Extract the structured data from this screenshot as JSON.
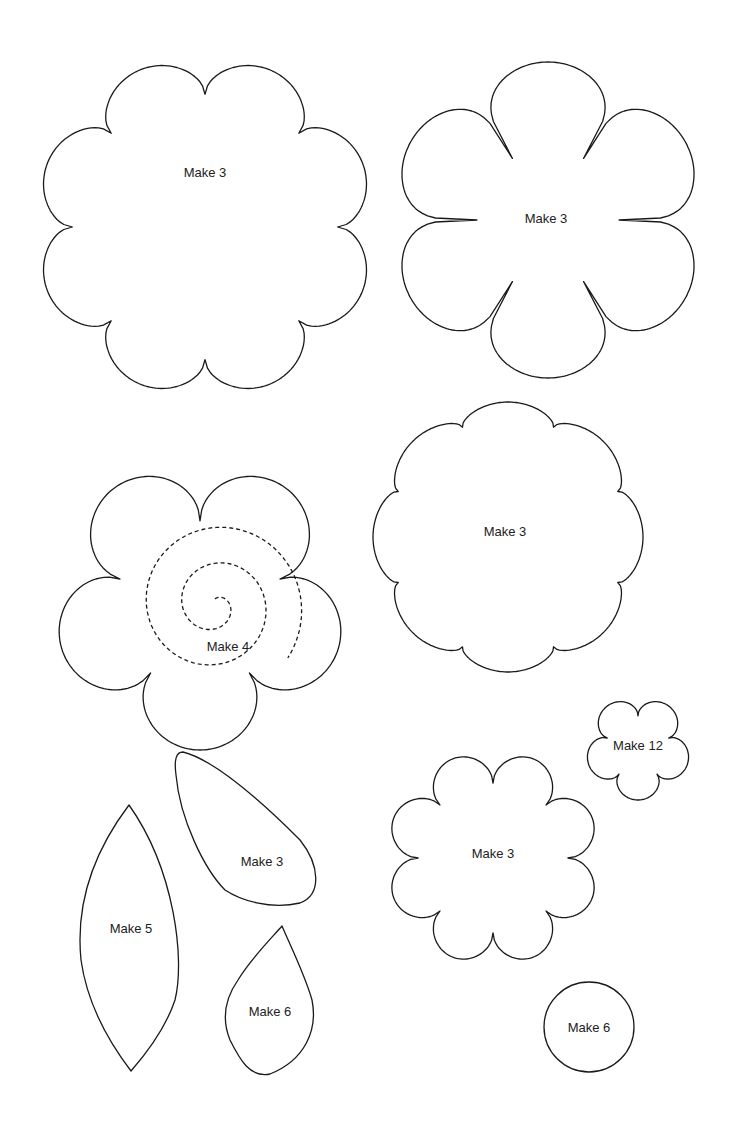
{
  "colors": {
    "stroke": "#1a1a1a",
    "background": "#ffffff",
    "text": "#222222"
  },
  "templates": [
    {
      "id": "flower-8-large",
      "type": "scallop",
      "cx": 205,
      "cy": 227,
      "r": 170,
      "petals": 8,
      "depth": 0.22,
      "rot": 0,
      "label": "Make 3",
      "lx": 205,
      "ly": 172
    },
    {
      "id": "flower-6-pointed",
      "type": "notched",
      "cx": 548,
      "cy": 220,
      "r": 158,
      "petals": 6,
      "notch": 0.55,
      "rot": 0,
      "label": "Make 3",
      "lx": 546,
      "ly": 218
    },
    {
      "id": "flower-5-spiral",
      "type": "scallop",
      "cx": 200,
      "cy": 605,
      "r": 145,
      "petals": 5,
      "depth": 0.42,
      "rot": -90,
      "label": "Make 4",
      "lx": 228,
      "ly": 646
    },
    {
      "id": "flower-8-medium",
      "type": "scallop",
      "cx": 508,
      "cy": 537,
      "r": 135,
      "petals": 8,
      "depth": 0.12,
      "rot": 22.5,
      "label": "Make 3",
      "lx": 505,
      "ly": 531
    },
    {
      "id": "flower-5-small",
      "type": "scallop",
      "cx": 638,
      "cy": 748,
      "r": 52,
      "petals": 5,
      "depth": 0.38,
      "rot": -90,
      "label": "Make 12",
      "lx": 638,
      "ly": 745
    },
    {
      "id": "flower-8-wavy",
      "type": "scallop",
      "cx": 493,
      "cy": 858,
      "r": 107,
      "petals": 8,
      "depth": 0.3,
      "rot": -90,
      "label": "Make 3",
      "lx": 493,
      "ly": 853
    },
    {
      "id": "circle",
      "type": "circle",
      "cx": 589,
      "cy": 1027,
      "r": 45,
      "label": "Make 6",
      "lx": 589,
      "ly": 1027
    },
    {
      "id": "leaf-long",
      "type": "path",
      "d": "M129,805 C175,870 185,960 175,1000 C165,1030 145,1055 131,1071 C115,1050 88,1010 81,960 C75,900 95,850 129,805 Z",
      "label": "Make 5",
      "lx": 131,
      "ly": 928
    },
    {
      "id": "petal-teardrop",
      "type": "path",
      "d": "M183,752 C215,760 260,800 300,840 C320,865 322,895 300,903 C270,910 240,900 225,890 C205,870 180,820 176,775 C174,760 176,752 183,752 Z",
      "label": "Make 3",
      "lx": 262,
      "ly": 861
    },
    {
      "id": "leaf-small",
      "type": "path",
      "d": "M282,926 C290,945 305,975 312,1000 C318,1030 305,1060 270,1074 C250,1078 240,1060 230,1040 C222,1020 224,1000 238,980 C250,960 265,945 282,926 Z",
      "label": "Make 6",
      "lx": 270,
      "ly": 1011
    }
  ],
  "spiral": {
    "cx": 215,
    "cy": 605,
    "turns": 2.35,
    "rmax": 90,
    "startAngle": 0
  }
}
